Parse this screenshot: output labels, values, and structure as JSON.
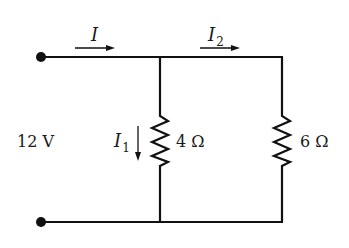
{
  "diagram": {
    "type": "parallel resistor circuit",
    "source": {
      "label": "12 V",
      "terminals": [
        "top-left dot",
        "bottom-left dot"
      ]
    },
    "currents": {
      "total": {
        "symbol": "I",
        "direction": "right"
      },
      "branch1": {
        "symbol": "I",
        "subscript": "1",
        "direction": "down"
      },
      "branch2": {
        "symbol": "I",
        "subscript": "2",
        "direction": "right"
      }
    },
    "resistors": [
      {
        "label": "4 Ω",
        "branch": "middle"
      },
      {
        "label": "6 Ω",
        "branch": "right"
      }
    ],
    "colors": {
      "wire": "#111111",
      "background": "#ffffff"
    }
  }
}
